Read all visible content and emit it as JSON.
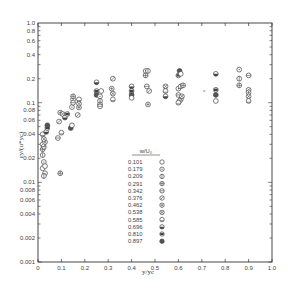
{
  "chart_data": {
    "type": "scatter",
    "title": "",
    "xlabel": "y/yc",
    "ylabel": "εy/(u*yc)",
    "xlim": [
      0,
      1.0
    ],
    "ylim": [
      0.001,
      1.0
    ],
    "yscale": "log",
    "grid": false,
    "legend_position": "center-bottom",
    "legend_title": "w/U₀",
    "x_ticks": [
      "0",
      "0.1",
      "0.2",
      "0.3",
      "0.4",
      "0.5",
      "0.6",
      "0.7",
      "0.8",
      "0.9",
      "1.0"
    ],
    "y_ticks": [
      "1.0",
      "0.8",
      "0.6",
      "0.4",
      "0.2",
      "0.1",
      "0.08",
      "0.06",
      "0.04",
      "0.02",
      "0.01",
      "0.008",
      "0.006",
      "0.004",
      "0.002",
      "0.001"
    ],
    "legend": [
      {
        "value": "0.101",
        "marker": "open-circle"
      },
      {
        "value": "0.179",
        "marker": "circle-dot"
      },
      {
        "value": "0.209",
        "marker": "circle-vbar"
      },
      {
        "value": "0.291",
        "marker": "circle-cross"
      },
      {
        "value": "0.342",
        "marker": "circle-hbar"
      },
      {
        "value": "0.376",
        "marker": "circle-slash"
      },
      {
        "value": "0.462",
        "marker": "circle-plus"
      },
      {
        "value": "0.538",
        "marker": "circle-x"
      },
      {
        "value": "0.585",
        "marker": "circle-lowbar"
      },
      {
        "value": "0.696",
        "marker": "circle-half"
      },
      {
        "value": "0.810",
        "marker": "circle-filled-band"
      },
      {
        "value": "0.897",
        "marker": "circle-dark"
      }
    ],
    "points": [
      {
        "x": 0.02,
        "y": 0.015
      },
      {
        "x": 0.025,
        "y": 0.018
      },
      {
        "x": 0.02,
        "y": 0.022
      },
      {
        "x": 0.02,
        "y": 0.026
      },
      {
        "x": 0.025,
        "y": 0.028
      },
      {
        "x": 0.02,
        "y": 0.03
      },
      {
        "x": 0.03,
        "y": 0.032
      },
      {
        "x": 0.025,
        "y": 0.035
      },
      {
        "x": 0.02,
        "y": 0.04
      },
      {
        "x": 0.035,
        "y": 0.043
      },
      {
        "x": 0.04,
        "y": 0.048
      },
      {
        "x": 0.04,
        "y": 0.052
      },
      {
        "x": 0.03,
        "y": 0.016
      },
      {
        "x": 0.03,
        "y": 0.013
      },
      {
        "x": 0.025,
        "y": 0.012
      },
      {
        "x": 0.095,
        "y": 0.013
      },
      {
        "x": 0.085,
        "y": 0.036
      },
      {
        "x": 0.09,
        "y": 0.058
      },
      {
        "x": 0.095,
        "y": 0.075
      },
      {
        "x": 0.105,
        "y": 0.072
      },
      {
        "x": 0.1,
        "y": 0.042
      },
      {
        "x": 0.115,
        "y": 0.065
      },
      {
        "x": 0.125,
        "y": 0.072
      },
      {
        "x": 0.14,
        "y": 0.048
      },
      {
        "x": 0.145,
        "y": 0.052
      },
      {
        "x": 0.145,
        "y": 0.088
      },
      {
        "x": 0.15,
        "y": 0.11
      },
      {
        "x": 0.15,
        "y": 0.12
      },
      {
        "x": 0.15,
        "y": 0.1
      },
      {
        "x": 0.17,
        "y": 0.07
      },
      {
        "x": 0.175,
        "y": 0.087
      },
      {
        "x": 0.175,
        "y": 0.097
      },
      {
        "x": 0.175,
        "y": 0.11
      },
      {
        "x": 0.25,
        "y": 0.18
      },
      {
        "x": 0.25,
        "y": 0.14
      },
      {
        "x": 0.25,
        "y": 0.125
      },
      {
        "x": 0.27,
        "y": 0.14
      },
      {
        "x": 0.265,
        "y": 0.12
      },
      {
        "x": 0.265,
        "y": 0.105
      },
      {
        "x": 0.265,
        "y": 0.095
      },
      {
        "x": 0.265,
        "y": 0.09
      },
      {
        "x": 0.32,
        "y": 0.2
      },
      {
        "x": 0.315,
        "y": 0.15
      },
      {
        "x": 0.32,
        "y": 0.13
      },
      {
        "x": 0.32,
        "y": 0.11
      },
      {
        "x": 0.4,
        "y": 0.16
      },
      {
        "x": 0.4,
        "y": 0.14
      },
      {
        "x": 0.4,
        "y": 0.125
      },
      {
        "x": 0.4,
        "y": 0.115
      },
      {
        "x": 0.46,
        "y": 0.25
      },
      {
        "x": 0.47,
        "y": 0.25
      },
      {
        "x": 0.46,
        "y": 0.22
      },
      {
        "x": 0.465,
        "y": 0.16
      },
      {
        "x": 0.475,
        "y": 0.14
      },
      {
        "x": 0.47,
        "y": 0.095
      },
      {
        "x": 0.545,
        "y": 0.16
      },
      {
        "x": 0.545,
        "y": 0.14
      },
      {
        "x": 0.545,
        "y": 0.12
      },
      {
        "x": 0.6,
        "y": 0.22
      },
      {
        "x": 0.605,
        "y": 0.25
      },
      {
        "x": 0.61,
        "y": 0.23
      },
      {
        "x": 0.6,
        "y": 0.15
      },
      {
        "x": 0.61,
        "y": 0.16
      },
      {
        "x": 0.62,
        "y": 0.165
      },
      {
        "x": 0.6,
        "y": 0.125
      },
      {
        "x": 0.61,
        "y": 0.11
      },
      {
        "x": 0.605,
        "y": 0.105
      },
      {
        "x": 0.615,
        "y": 0.12
      },
      {
        "x": 0.6,
        "y": 0.1
      },
      {
        "x": 0.76,
        "y": 0.23
      },
      {
        "x": 0.76,
        "y": 0.145
      },
      {
        "x": 0.76,
        "y": 0.125
      },
      {
        "x": 0.76,
        "y": 0.105
      },
      {
        "x": 0.86,
        "y": 0.26
      },
      {
        "x": 0.86,
        "y": 0.2
      },
      {
        "x": 0.86,
        "y": 0.165
      },
      {
        "x": 0.9,
        "y": 0.22
      },
      {
        "x": 0.9,
        "y": 0.145
      },
      {
        "x": 0.9,
        "y": 0.135
      },
      {
        "x": 0.9,
        "y": 0.12
      },
      {
        "x": 0.9,
        "y": 0.105
      }
    ],
    "annotations": [
      "-"
    ]
  }
}
